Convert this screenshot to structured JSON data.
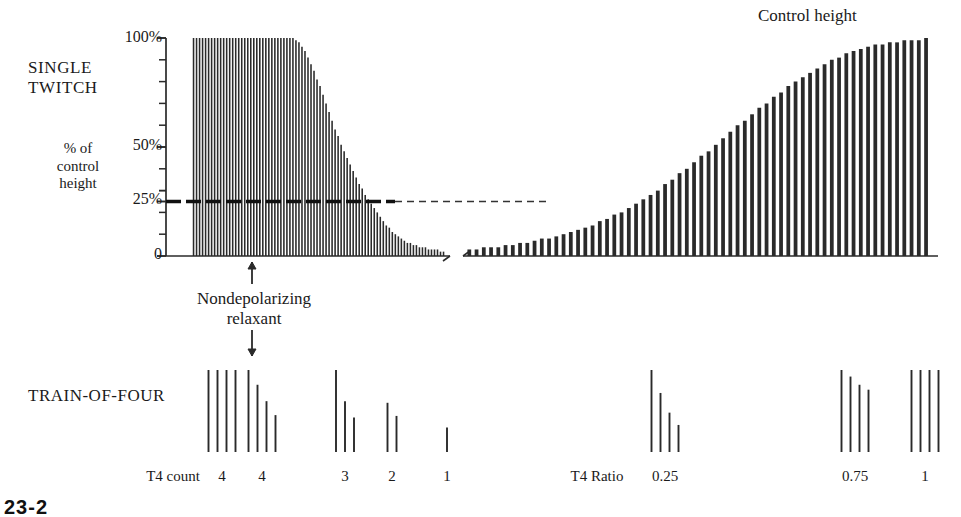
{
  "figure": {
    "title_top_right": "Control height",
    "panel_single_twitch_label": "SINGLE\nTWITCH",
    "panel_axis_units_label": "% of\ncontrol\nheight",
    "panel_tof_label": "TRAIN-OF-FOUR",
    "drug_marker_label": "Nondepolarizing\nrelaxant",
    "caption_partial": "23-2",
    "reference_line_note": "dashed line at 25% of control height"
  },
  "axis": {
    "ticks_major": [
      {
        "value": 100,
        "label": "100%"
      },
      {
        "value": 50,
        "label": "50%"
      },
      {
        "value": 25,
        "label": "25%"
      },
      {
        "value": 0,
        "label": "0"
      }
    ],
    "minor_tick_step": 10,
    "ylim": [
      0,
      100
    ],
    "break_note": "x-axis break between depression and recovery phases"
  },
  "tof": {
    "count_row_label": "T4 count",
    "ratio_row_label": "T4 Ratio",
    "groups": [
      {
        "id": "g1",
        "label": "4",
        "metric": "count",
        "x": 222,
        "bars": [
          100,
          100,
          100,
          100
        ]
      },
      {
        "id": "g2",
        "label": "4",
        "metric": "count",
        "x": 262,
        "bars": [
          100,
          82,
          62,
          45
        ]
      },
      {
        "id": "g3",
        "label": "3",
        "metric": "count",
        "x": 345,
        "bars": [
          100,
          62,
          42,
          0
        ]
      },
      {
        "id": "g4",
        "label": "2",
        "metric": "count",
        "x": 392,
        "bars": [
          60,
          44,
          0,
          0
        ]
      },
      {
        "id": "g5",
        "label": "1",
        "metric": "count",
        "x": 447,
        "bars": [
          30,
          0,
          0,
          0
        ]
      },
      {
        "id": "g6",
        "label": "0.25",
        "metric": "ratio",
        "x": 665,
        "bars": [
          100,
          72,
          48,
          33
        ]
      },
      {
        "id": "g7",
        "label": "0.75",
        "metric": "ratio",
        "x": 855,
        "bars": [
          100,
          92,
          82,
          76
        ]
      },
      {
        "id": "g8",
        "label": "1",
        "metric": "ratio",
        "x": 925,
        "bars": [
          100,
          100,
          100,
          100
        ]
      }
    ]
  },
  "chart_data": {
    "type": "bar",
    "xlabel": "",
    "ylabel": "% of control height",
    "ylim": [
      0,
      100
    ],
    "grid": false,
    "legend": "none",
    "annotations": [
      {
        "text": "Control height",
        "at": "top-right"
      },
      {
        "text": "Nondepolarizing relaxant",
        "at": "x=252, below axis (arrow)"
      },
      {
        "text": "25% reference line",
        "at": "y=25, dashed"
      }
    ],
    "series": [
      {
        "name": "Twitch height (depression phase)",
        "values": [
          100,
          100,
          100,
          100,
          100,
          100,
          100,
          100,
          100,
          100,
          100,
          100,
          100,
          100,
          100,
          100,
          100,
          100,
          100,
          100,
          100,
          100,
          100,
          100,
          100,
          100,
          100,
          100,
          100,
          100,
          100,
          100,
          100,
          100,
          99,
          98,
          96,
          94,
          91,
          88,
          85,
          81,
          78,
          74,
          70,
          66,
          62,
          58,
          55,
          51,
          48,
          45,
          42,
          39,
          36,
          33,
          31,
          28,
          26,
          24,
          22,
          20,
          18,
          16,
          14,
          13,
          11,
          10,
          9,
          8,
          7,
          6,
          6,
          5,
          5,
          4,
          4,
          4,
          3,
          3,
          3,
          3,
          2,
          2
        ]
      },
      {
        "name": "Twitch height (recovery phase)",
        "values": [
          3,
          3,
          4,
          4,
          4,
          5,
          5,
          6,
          6,
          7,
          8,
          8,
          9,
          10,
          11,
          12,
          13,
          14,
          16,
          17,
          19,
          20,
          22,
          24,
          26,
          28,
          30,
          33,
          35,
          38,
          40,
          43,
          46,
          48,
          51,
          54,
          57,
          60,
          62,
          65,
          68,
          70,
          73,
          75,
          78,
          80,
          82,
          84,
          86,
          88,
          90,
          91,
          93,
          94,
          95,
          96,
          97,
          97,
          98,
          98,
          99,
          99,
          99,
          100
        ]
      }
    ]
  }
}
